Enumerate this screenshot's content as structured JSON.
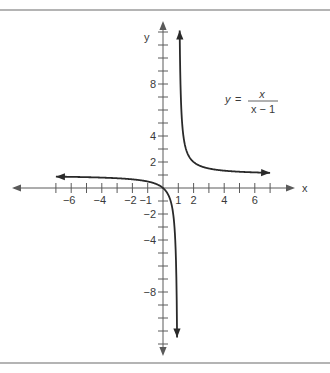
{
  "chart_data": {
    "type": "line",
    "title": "",
    "equation": {
      "lhs": "y",
      "equals": "=",
      "numerator": "x",
      "denominator": "x − 1"
    },
    "xlabel": "x",
    "ylabel": "y",
    "xlim": [
      -7.5,
      8
    ],
    "ylim": [
      -12.5,
      12.5
    ],
    "grid": false,
    "x_ticks": [
      -7,
      -6,
      -5,
      -4,
      -3,
      -2,
      -1,
      1,
      2,
      3,
      4,
      5,
      6,
      7
    ],
    "x_tick_labels": [
      {
        "value": -6,
        "text": "−6"
      },
      {
        "value": -4,
        "text": "−4"
      },
      {
        "value": -2,
        "text": "−2"
      },
      {
        "value": -1,
        "text": "−1"
      },
      {
        "value": 1,
        "text": "1"
      },
      {
        "value": 2,
        "text": "2"
      },
      {
        "value": 4,
        "text": "4"
      },
      {
        "value": 6,
        "text": "6"
      }
    ],
    "y_ticks": [
      -12,
      -11,
      -10,
      -9,
      -8,
      -7,
      -6,
      -5,
      -4,
      -3,
      -2,
      -1,
      1,
      2,
      3,
      4,
      5,
      6,
      7,
      8,
      9,
      10,
      11,
      12
    ],
    "y_tick_labels": [
      {
        "value": 8,
        "text": "8"
      },
      {
        "value": 4,
        "text": "4"
      },
      {
        "value": 2,
        "text": "2"
      },
      {
        "value": -2,
        "text": "−2"
      },
      {
        "value": -4,
        "text": "−4"
      },
      {
        "value": -8,
        "text": "−8"
      }
    ],
    "series": [
      {
        "name": "y = x/(x-1), left branch",
        "function": "x/(x-1)",
        "domain": [
          -7.0,
          0.92
        ],
        "arrow_at_start": true,
        "arrow_at_end": true
      },
      {
        "name": "y = x/(x-1), right branch",
        "function": "x/(x-1)",
        "domain": [
          1.09,
          7.0
        ],
        "arrow_at_start": true,
        "arrow_at_end": true
      }
    ],
    "asymptotes": {
      "vertical": 1,
      "horizontal": 1
    }
  }
}
